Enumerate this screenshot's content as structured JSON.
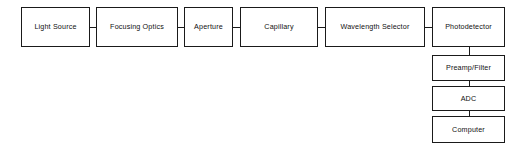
{
  "diagram": {
    "type": "block-flow-diagram",
    "background_color": "#ffffff",
    "line_color": "#1a1a1a",
    "text_color": "#111111",
    "optical_path": {
      "label": "optical-path-chain",
      "orientation": "horizontal"
    },
    "signal_path": {
      "label": "signal-processing-chain",
      "orientation": "vertical"
    },
    "nodes": [
      {
        "id": "light-source",
        "label": "Light Source",
        "x": 21,
        "y": 7,
        "w": 69,
        "h": 40
      },
      {
        "id": "focusing-optics",
        "label": "Focusing Optics",
        "x": 96,
        "y": 7,
        "w": 82,
        "h": 40
      },
      {
        "id": "aperture",
        "label": "Aperture",
        "x": 184,
        "y": 7,
        "w": 49,
        "h": 40
      },
      {
        "id": "capillary",
        "label": "Capillary",
        "x": 240,
        "y": 7,
        "w": 78,
        "h": 40
      },
      {
        "id": "wavelength-selector",
        "label": "Wavelength Selector",
        "x": 325,
        "y": 7,
        "w": 100,
        "h": 40
      },
      {
        "id": "photodetector",
        "label": "Photodetector",
        "x": 432,
        "y": 7,
        "w": 73,
        "h": 40
      },
      {
        "id": "preamp-filter",
        "label": "Preamp/Filter",
        "x": 432,
        "y": 55,
        "w": 73,
        "h": 26
      },
      {
        "id": "adc",
        "label": "ADC",
        "x": 432,
        "y": 86,
        "w": 73,
        "h": 25
      },
      {
        "id": "computer",
        "label": "Computer",
        "x": 432,
        "y": 116,
        "w": 73,
        "h": 27
      }
    ],
    "connectors": [
      {
        "id": "light-source-to-focusing-optics",
        "orientation": "horizontal",
        "x": 90,
        "y": 27,
        "length": 6
      },
      {
        "id": "focusing-optics-to-aperture",
        "orientation": "horizontal",
        "x": 178,
        "y": 27,
        "length": 6
      },
      {
        "id": "aperture-to-capillary",
        "orientation": "horizontal",
        "x": 233,
        "y": 27,
        "length": 7
      },
      {
        "id": "capillary-to-wavelength-selector",
        "orientation": "horizontal",
        "x": 318,
        "y": 27,
        "length": 7
      },
      {
        "id": "wavelength-selector-to-photodetector",
        "orientation": "horizontal",
        "x": 425,
        "y": 27,
        "length": 7
      },
      {
        "id": "photodetector-to-preamp-filter",
        "orientation": "vertical",
        "x": 468.5,
        "y": 47,
        "length": 8
      },
      {
        "id": "preamp-filter-to-adc",
        "orientation": "vertical",
        "x": 468.5,
        "y": 81,
        "length": 5
      },
      {
        "id": "adc-to-computer",
        "orientation": "vertical",
        "x": 468.5,
        "y": 111,
        "length": 5
      }
    ]
  }
}
